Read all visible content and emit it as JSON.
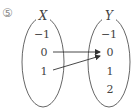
{
  "problem_number": "⑤",
  "sets": {
    "domain": {
      "label": "X",
      "elements": [
        "−1",
        "0",
        "1"
      ]
    },
    "codomain": {
      "label": "Y",
      "elements": [
        "−1",
        "0",
        "1",
        "2"
      ]
    }
  },
  "mappings": [
    {
      "from": "0",
      "to": "0"
    },
    {
      "from": "1",
      "to": "0"
    }
  ]
}
